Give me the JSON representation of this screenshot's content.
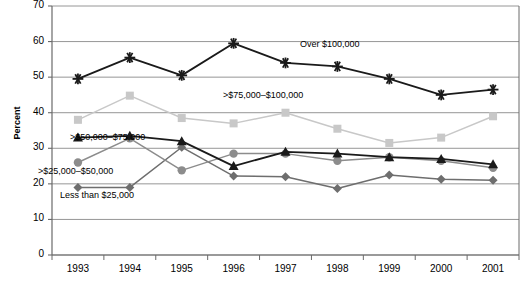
{
  "chart_data": {
    "type": "line",
    "title": "",
    "xlabel": "",
    "ylabel": "Percent",
    "categories": [
      "1993",
      "1994",
      "1995",
      "1996",
      "1997",
      "1998",
      "1999",
      "2000",
      "2001"
    ],
    "ylim": [
      0,
      70
    ],
    "yticks": [
      0,
      10,
      20,
      30,
      40,
      50,
      60,
      70
    ],
    "grid": true,
    "legend_position": "inline-annotations",
    "series": [
      {
        "name": "Over $100,000",
        "color": "#1a1a1a",
        "marker": "asterisk",
        "values": [
          49.5,
          55.5,
          50.5,
          59.5,
          54.0,
          53.0,
          49.5,
          45.0,
          46.5
        ],
        "label_x": 1997,
        "label_y": 56.5
      },
      {
        "name": ">$75,000–$100,000",
        "color": "#c8c8c8",
        "marker": "square",
        "values": [
          38.0,
          44.8,
          38.5,
          37.0,
          40.0,
          35.5,
          31.5,
          33.0,
          39.0
        ],
        "label_x": 1996,
        "label_y": 44.0
      },
      {
        "name": ">$50,000–$75,000",
        "color": "#1a1a1a",
        "marker": "triangle",
        "values": [
          33.0,
          33.5,
          32.0,
          25.0,
          29.0,
          28.5,
          27.5,
          27.0,
          25.5
        ],
        "label_x": 1994,
        "label_y": 37.0
      },
      {
        "name": ">$25,000–$50,000",
        "color": "#8c8c8c",
        "marker": "circle",
        "values": [
          26.0,
          32.8,
          23.8,
          28.5,
          28.5,
          26.5,
          27.5,
          26.5,
          24.5
        ],
        "label_x": 1994,
        "label_y": 24.5
      },
      {
        "name": "Less than $25,000",
        "color": "#6e6e6e",
        "marker": "diamond",
        "values": [
          19.0,
          19.0,
          30.3,
          22.2,
          22.0,
          18.7,
          22.5,
          21.3,
          21.0
        ],
        "label_x": 1994,
        "label_y": 16.0
      }
    ]
  },
  "axis": {
    "y_title": "Percent",
    "y_tick_labels": [
      "70",
      "60",
      "50",
      "40",
      "30",
      "20",
      "10",
      "0"
    ],
    "x_tick_labels": [
      "1993",
      "1994",
      "1995",
      "1996",
      "1997",
      "1998",
      "1999",
      "2000",
      "2001"
    ]
  },
  "annotations": {
    "over_100k": "Over $100,000",
    "gt_75k_100k": ">$75,000–$100,000",
    "gt_50k_75k": ">$50,000–$75,000",
    "gt_25k_50k": ">$25,000–$50,000",
    "less_25k": "Less than $25,000"
  },
  "colors": {
    "over_100k": "#1a1a1a",
    "gt_75k_100k": "#c8c8c8",
    "gt_50k_75k": "#1a1a1a",
    "gt_25k_50k": "#8c8c8c",
    "less_25k": "#6e6e6e",
    "grid": "#8a8a8a",
    "axis": "#6a6a6a",
    "background": "#ffffff"
  }
}
